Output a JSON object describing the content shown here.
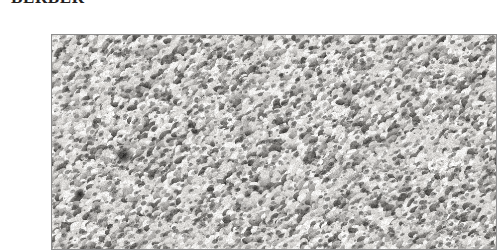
{
  "page": {
    "background_color": "#ffffff",
    "width": 468,
    "height": 242
  },
  "caption": {
    "text": "BERBER",
    "style": "bold serif small-caps heading, clipped at top of crop",
    "color": "#23201e"
  },
  "plate": {
    "name": "berber-carpet-texture",
    "alt_text": "Close-up grayscale photograph of berber loop-pile carpet",
    "border_color": "#8d8d8d",
    "border_width_px": 1,
    "x": 11,
    "y": 18,
    "width": 446,
    "height": 216,
    "palette": {
      "highlight": "#f2f1ef",
      "light": "#d8d6d3",
      "mid": "#a9a7a4",
      "shadow": "#6b6966",
      "deep_shadow": "#3a3937",
      "darkest_fleck": "#1d1c1b",
      "base": "#c9c9c9"
    },
    "texture": {
      "material": "berber loop pile carpet",
      "loop_width_px": 7,
      "loop_height_px": 4.5,
      "loop_orientation_deg": -27,
      "loop_count_approx": 7400,
      "banding_direction": "diagonal, upper-left to lower-right",
      "notable_marks": [
        {
          "name": "dark-fleck-left",
          "x": 72,
          "y": 122,
          "radius": 5
        },
        {
          "name": "dark-fleck-lower-left",
          "x": 28,
          "y": 160,
          "radius": 3
        },
        {
          "name": "dark-fleck-center",
          "x": 205,
          "y": 155,
          "radius": 2
        }
      ]
    }
  }
}
